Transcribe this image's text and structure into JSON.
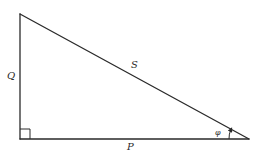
{
  "diagram": {
    "type": "right-triangle",
    "vertices": {
      "top": [
        20,
        14
      ],
      "right_angle": [
        20,
        139
      ],
      "acute": [
        249,
        139
      ]
    },
    "right_angle_marker_size": 10,
    "labels": {
      "vertical_side": "Q",
      "hypotenuse": "S",
      "horizontal_side": "P",
      "angle": "φ"
    },
    "stroke_color": "#2a2a2a",
    "background_color": "#ffffff"
  }
}
